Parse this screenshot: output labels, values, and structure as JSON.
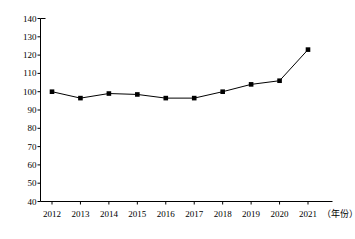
{
  "chart_data": {
    "type": "line",
    "title": "",
    "subtitle": "",
    "xlabel": "（年份）",
    "ylabel": "",
    "categories": [
      "2012",
      "2013",
      "2014",
      "2015",
      "2016",
      "2017",
      "2018",
      "2019",
      "2020",
      "2021"
    ],
    "values": [
      100,
      96.5,
      99,
      98.5,
      96.5,
      96.5,
      100,
      104,
      106,
      123
    ],
    "series": [
      {
        "name": "",
        "values": [
          100,
          96.5,
          99,
          98.5,
          96.5,
          96.5,
          100,
          104,
          106,
          123
        ]
      }
    ],
    "ylim": [
      40,
      140
    ],
    "ytick_step": 10,
    "yticks": [
      "40",
      "50",
      "60",
      "70",
      "80",
      "90",
      "100",
      "110",
      "120",
      "130",
      "140"
    ],
    "xticks": [
      "2012",
      "2013",
      "2014",
      "2015",
      "2016",
      "2017",
      "2018",
      "2019",
      "2020",
      "2021"
    ],
    "grid": false,
    "legend": null,
    "legend_position": "none",
    "marker": "square",
    "marker_color": "#000000",
    "line_color": "#000000",
    "background_color": "#ffffff",
    "annotations": []
  }
}
